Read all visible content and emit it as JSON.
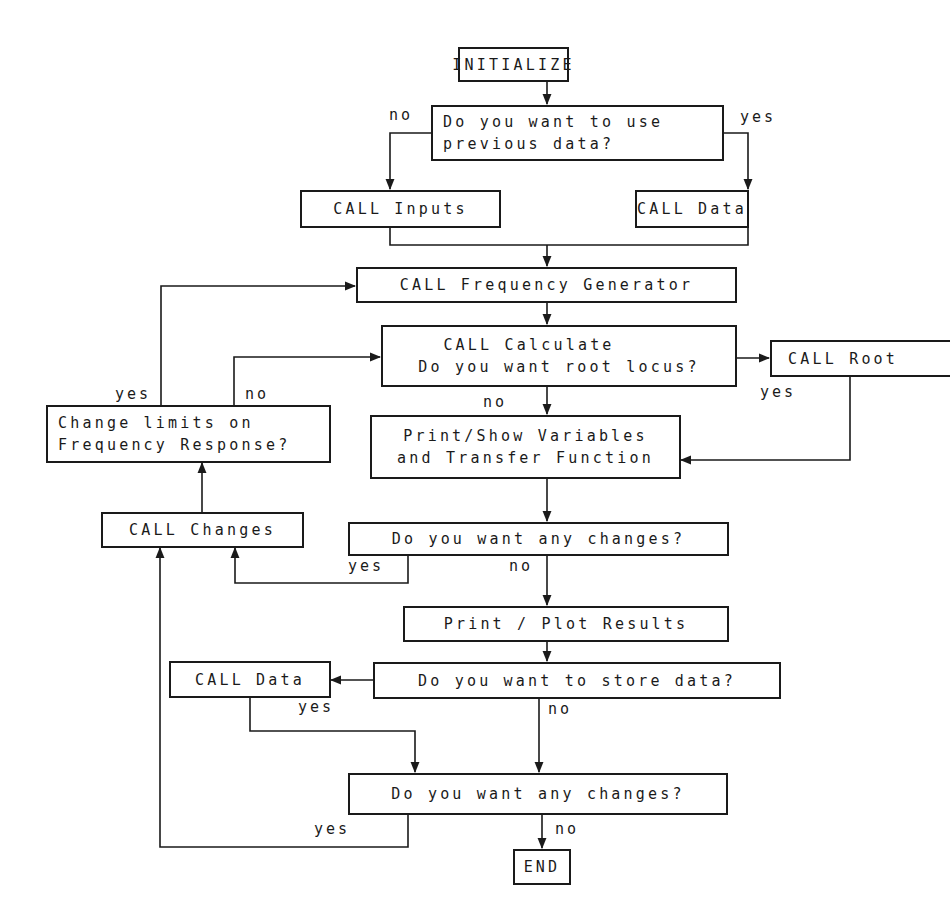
{
  "diagram": {
    "type": "flowchart",
    "nodes": {
      "initialize": {
        "lines": [
          "INITIALIZE"
        ]
      },
      "use_previous": {
        "lines": [
          "Do you want to use",
          "previous data?"
        ]
      },
      "call_inputs": {
        "lines": [
          "CALL Inputs"
        ]
      },
      "call_data_top": {
        "lines": [
          "CALL Data"
        ]
      },
      "freq_gen": {
        "lines": [
          "CALL Frequency Generator"
        ]
      },
      "calculate": {
        "lines": [
          "CALL Calculate",
          "Do you want root locus?"
        ]
      },
      "call_root": {
        "lines": [
          "CALL Root"
        ]
      },
      "change_limits": {
        "lines": [
          "Change limits on",
          "Frequency Response?"
        ]
      },
      "print_show": {
        "lines": [
          "Print/Show Variables",
          "and Transfer Function"
        ]
      },
      "call_changes": {
        "lines": [
          "CALL Changes"
        ]
      },
      "any_changes_1": {
        "lines": [
          "Do you want any changes?"
        ]
      },
      "print_plot": {
        "lines": [
          "Print / Plot Results"
        ]
      },
      "store_data": {
        "lines": [
          "Do you want to store data?"
        ]
      },
      "call_data_bottom": {
        "lines": [
          "CALL Data"
        ]
      },
      "any_changes_2": {
        "lines": [
          "Do you want any changes?"
        ]
      },
      "end": {
        "lines": [
          "END"
        ]
      }
    },
    "labels": {
      "use_previous_no": "no",
      "use_previous_yes": "yes",
      "root_yes": "yes",
      "root_no": "no",
      "limits_yes": "yes",
      "limits_no": "no",
      "changes1_yes": "yes",
      "changes1_no": "no",
      "store_yes": "yes",
      "store_no": "no",
      "changes2_yes": "yes",
      "changes2_no": "no"
    },
    "edges": [
      {
        "from": "initialize",
        "to": "use_previous"
      },
      {
        "from": "use_previous",
        "to": "call_inputs",
        "label": "no"
      },
      {
        "from": "use_previous",
        "to": "call_data_top",
        "label": "yes"
      },
      {
        "from": "call_inputs",
        "to": "freq_gen"
      },
      {
        "from": "call_data_top",
        "to": "freq_gen"
      },
      {
        "from": "freq_gen",
        "to": "calculate"
      },
      {
        "from": "calculate",
        "to": "call_root",
        "label": "yes"
      },
      {
        "from": "calculate",
        "to": "print_show",
        "label": "no"
      },
      {
        "from": "call_root",
        "to": "print_show"
      },
      {
        "from": "print_show",
        "to": "any_changes_1"
      },
      {
        "from": "any_changes_1",
        "to": "call_changes",
        "label": "yes"
      },
      {
        "from": "any_changes_1",
        "to": "print_plot",
        "label": "no"
      },
      {
        "from": "call_changes",
        "to": "change_limits"
      },
      {
        "from": "change_limits",
        "to": "freq_gen",
        "label": "yes"
      },
      {
        "from": "change_limits",
        "to": "calculate",
        "label": "no"
      },
      {
        "from": "print_plot",
        "to": "store_data"
      },
      {
        "from": "store_data",
        "to": "call_data_bottom",
        "label": "yes"
      },
      {
        "from": "store_data",
        "to": "any_changes_2",
        "label": "no"
      },
      {
        "from": "call_data_bottom",
        "to": "any_changes_2"
      },
      {
        "from": "any_changes_2",
        "to": "call_changes",
        "label": "yes"
      },
      {
        "from": "any_changes_2",
        "to": "end",
        "label": "no"
      }
    ]
  }
}
